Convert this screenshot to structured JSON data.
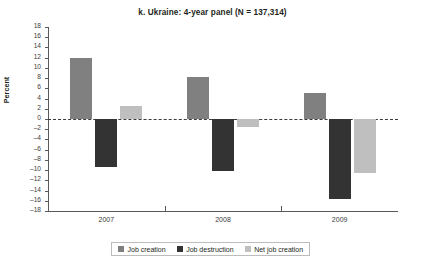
{
  "chart_data": {
    "type": "bar",
    "title": "k. Ukraine: 4-year panel (N = 137,314)",
    "xlabel": "",
    "ylabel": "Percent",
    "categories": [
      "2007",
      "2008",
      "2009"
    ],
    "ylim": [
      -18,
      18
    ],
    "ytick_step": 2,
    "yticks": [
      "18",
      "16",
      "14",
      "12",
      "10",
      "8",
      "6",
      "4",
      "2",
      "0",
      "-2",
      "-4",
      "-6",
      "-8",
      "-10",
      "-12",
      "-14",
      "-16",
      "-18"
    ],
    "grid": false,
    "zero_line": "dashed",
    "legend_position": "bottom",
    "series": [
      {
        "name": "Job creation",
        "color": "#808080",
        "values": [
          12.0,
          8.3,
          5.0
        ]
      },
      {
        "name": "Job destruction",
        "color": "#333333",
        "values": [
          -9.3,
          -10.1,
          -15.6
        ]
      },
      {
        "name": "Net job creation",
        "color": "#bfbfbf",
        "values": [
          2.5,
          -1.5,
          -10.5
        ]
      }
    ]
  }
}
